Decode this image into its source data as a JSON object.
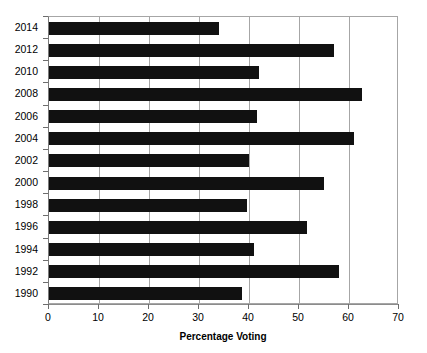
{
  "chart_data": {
    "type": "bar",
    "orientation": "horizontal",
    "title": "",
    "xlabel": "Percentage Voting",
    "ylabel": "",
    "xlim": [
      0,
      70
    ],
    "ylim": null,
    "grid": true,
    "legend": false,
    "bar_color": "#111111",
    "categories": [
      "2014",
      "2012",
      "2010",
      "2008",
      "2006",
      "2004",
      "2002",
      "2000",
      "1998",
      "1996",
      "1994",
      "1992",
      "1990"
    ],
    "values": [
      34,
      57,
      42,
      62.5,
      41.5,
      61,
      40,
      55,
      39.5,
      51.5,
      41,
      58,
      38.5
    ],
    "xticks": [
      "0",
      "10",
      "20",
      "30",
      "40",
      "50",
      "60",
      "70"
    ],
    "xtick_values": [
      0,
      10,
      20,
      30,
      40,
      50,
      60,
      70
    ],
    "series": [
      {
        "name": "Percentage Voting",
        "values": [
          34,
          57,
          42,
          62.5,
          41.5,
          61,
          40,
          55,
          39.5,
          51.5,
          41,
          58,
          38.5
        ]
      }
    ]
  },
  "axes": {
    "x_title": "Percentage Voting",
    "x_ticks": [
      {
        "label": "0",
        "value": 0
      },
      {
        "label": "10",
        "value": 10
      },
      {
        "label": "20",
        "value": 20
      },
      {
        "label": "30",
        "value": 30
      },
      {
        "label": "40",
        "value": 40
      },
      {
        "label": "50",
        "value": 50
      },
      {
        "label": "60",
        "value": 60
      },
      {
        "label": "70",
        "value": 70
      }
    ],
    "y_ticks": [
      {
        "label": "2014",
        "value": 34
      },
      {
        "label": "2012",
        "value": 57
      },
      {
        "label": "2010",
        "value": 42
      },
      {
        "label": "2008",
        "value": 62.5
      },
      {
        "label": "2006",
        "value": 41.5
      },
      {
        "label": "2004",
        "value": 61
      },
      {
        "label": "2002",
        "value": 40
      },
      {
        "label": "2000",
        "value": 55
      },
      {
        "label": "1998",
        "value": 39.5
      },
      {
        "label": "1996",
        "value": 51.5
      },
      {
        "label": "1994",
        "value": 41
      },
      {
        "label": "1992",
        "value": 58
      },
      {
        "label": "1990",
        "value": 38.5
      }
    ]
  },
  "colors": {
    "bar": "#111111",
    "grid": "#a6a6a6",
    "axis": "#6d6d6d",
    "background": "#ffffff",
    "text": "#000000"
  }
}
